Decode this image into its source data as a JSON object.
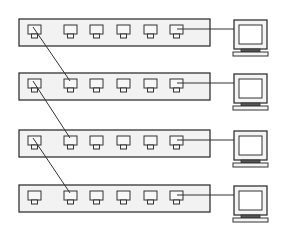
{
  "diagram": {
    "type": "network-topology",
    "colors": {
      "line": "#333333",
      "background": "#ffffff",
      "switch_fill": "#f2f2f2",
      "port_fill": "#f7f7f7"
    },
    "switches": [
      {
        "id": "switch-1",
        "y": 19,
        "ports": 6,
        "computer": "computer-1"
      },
      {
        "id": "switch-2",
        "y": 73,
        "ports": 6,
        "computer": "computer-2"
      },
      {
        "id": "switch-3",
        "y": 130,
        "ports": 6,
        "computer": "computer-3"
      },
      {
        "id": "switch-4",
        "y": 185,
        "ports": 6,
        "computer": "computer-4"
      }
    ],
    "uplinks": [
      {
        "from": "switch-1.port-1",
        "to": "switch-2.port-2"
      },
      {
        "from": "switch-2.port-1",
        "to": "switch-3.port-2"
      },
      {
        "from": "switch-3.port-1",
        "to": "switch-4.port-2"
      }
    ],
    "computer_links": [
      {
        "from": "switch-1.port-6",
        "to": "computer-1"
      },
      {
        "from": "switch-2.port-6",
        "to": "computer-2"
      },
      {
        "from": "switch-3.port-6",
        "to": "computer-3"
      },
      {
        "from": "switch-4.port-6",
        "to": "computer-4"
      }
    ]
  }
}
